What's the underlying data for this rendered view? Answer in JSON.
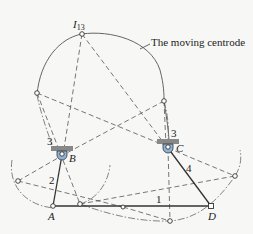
{
  "figure": {
    "annotation": "The moving centrode",
    "instant_center_label": "I",
    "instant_center_subscript": "13",
    "joint_labels": {
      "A": "A",
      "B": "B",
      "C": "C",
      "D": "D"
    },
    "link_labels": {
      "ground": "1",
      "crank_AB": "2",
      "coupler_at_B": "3",
      "coupler_at_C": "3",
      "rocker_CD": "4"
    }
  }
}
